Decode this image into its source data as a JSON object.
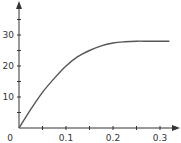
{
  "chart_data": {
    "type": "line",
    "title": "",
    "xlabel": "",
    "ylabel": "",
    "xlim": [
      0,
      0.34
    ],
    "ylim": [
      0,
      38
    ],
    "grid": false,
    "legend": null,
    "x_ticks": [
      0.05,
      0.1,
      0.15,
      0.2,
      0.25,
      0.3
    ],
    "x_tick_labels": [
      {
        "value": 0.1,
        "label": "0.1"
      },
      {
        "value": 0.2,
        "label": "0.2"
      },
      {
        "value": 0.3,
        "label": "0.3"
      }
    ],
    "y_ticks": [
      5,
      10,
      15,
      20,
      25,
      30,
      35
    ],
    "y_tick_labels": [
      {
        "value": 10,
        "label": "10"
      },
      {
        "value": 20,
        "label": "20"
      },
      {
        "value": 30,
        "label": "30"
      }
    ],
    "origin_label": "0",
    "series": [
      {
        "name": "curve",
        "color": "#555555",
        "x": [
          0,
          0.025,
          0.05,
          0.075,
          0.1,
          0.125,
          0.15,
          0.175,
          0.2,
          0.225,
          0.25,
          0.275,
          0.3,
          0.32
        ],
        "y": [
          0,
          6,
          11.5,
          16,
          20,
          23,
          25,
          26.5,
          27.4,
          27.8,
          28,
          28,
          28,
          28
        ]
      }
    ]
  }
}
